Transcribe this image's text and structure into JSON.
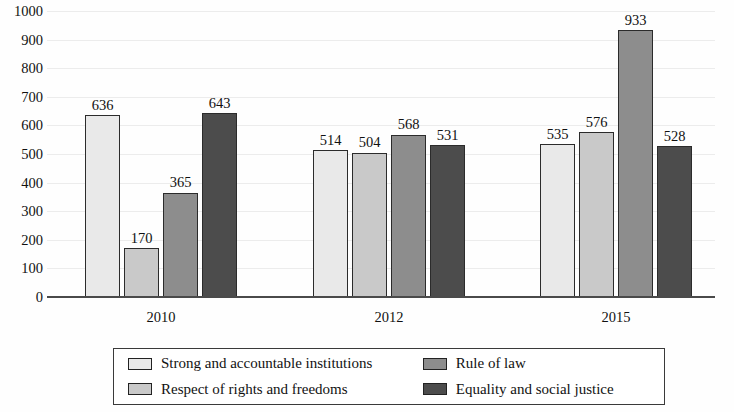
{
  "chart_data": {
    "type": "bar",
    "title": "",
    "subtitle": "",
    "xlabel": "",
    "ylabel": "",
    "categories": [
      "2010",
      "2012",
      "2015"
    ],
    "ylim": [
      0,
      1000
    ],
    "y_ticks": [
      0,
      100,
      200,
      300,
      400,
      500,
      600,
      700,
      800,
      900,
      1000
    ],
    "y_tick_labels": [
      "0",
      "100",
      "200",
      "300",
      "400",
      "500",
      "600",
      "700",
      "800",
      "900",
      "1000"
    ],
    "grid": true,
    "legend_position": "bottom",
    "data_labels": true,
    "series": [
      {
        "name": "Strong and accountable institutions",
        "color": "#e9e9e9",
        "values": [
          636,
          514,
          535
        ],
        "labels": [
          "636",
          "514",
          "535"
        ]
      },
      {
        "name": "Respect of rights and freedoms",
        "color": "#c9c9c9",
        "values": [
          170,
          504,
          576
        ],
        "labels": [
          "170",
          "504",
          "576"
        ]
      },
      {
        "name": "Rule of law",
        "color": "#8d8d8d",
        "values": [
          365,
          568,
          933
        ],
        "labels": [
          "365",
          "568",
          "933"
        ]
      },
      {
        "name": "Equality and social justice",
        "color": "#4c4c4c",
        "values": [
          643,
          531,
          528
        ],
        "labels": [
          "643",
          "531",
          "528"
        ]
      }
    ]
  }
}
